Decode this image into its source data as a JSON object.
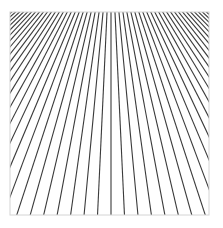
{
  "figure": {
    "frame": {
      "x": 10,
      "y": 12,
      "width": 199,
      "height": 203,
      "border_color": "#d4d4d4"
    },
    "vanishing_point": {
      "x": 111,
      "y": -73
    },
    "baseline_y": 215,
    "baseline_pitch": 13.7,
    "line_count_each_side": 60,
    "line_color": "#3a3a3a",
    "line_width": 1.1,
    "background": "#ffffff"
  }
}
